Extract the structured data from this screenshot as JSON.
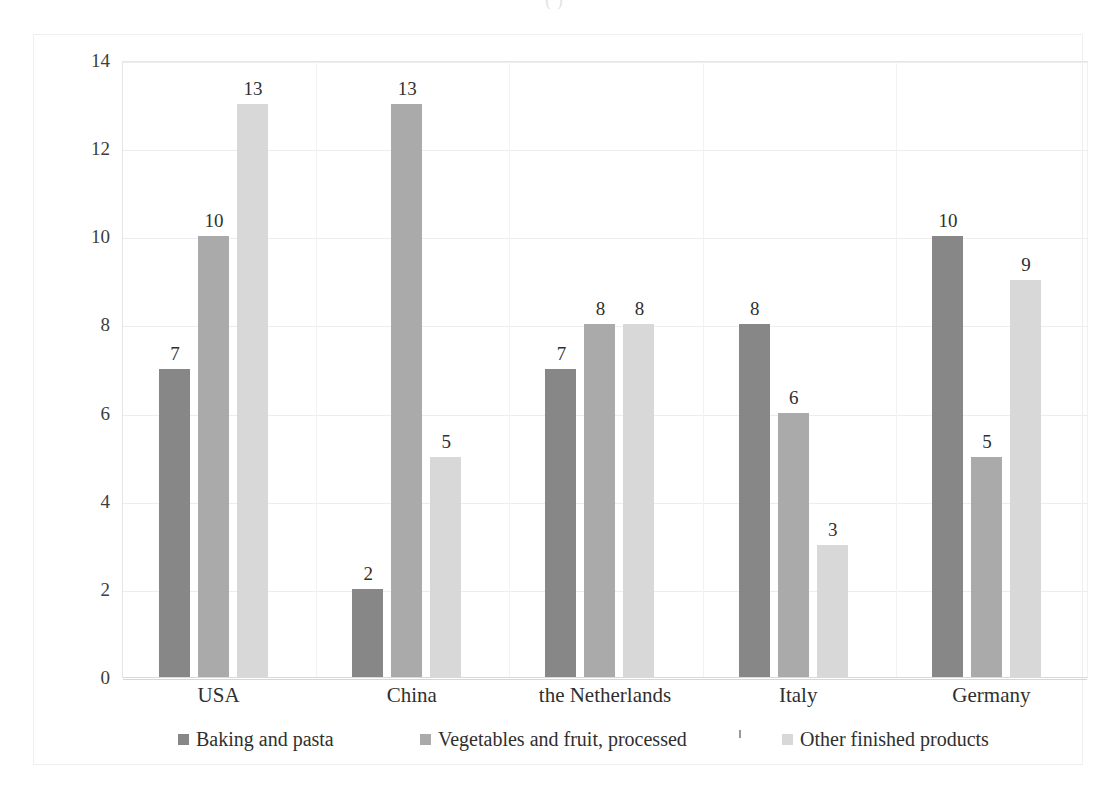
{
  "top_caption": "(           )",
  "chart_data": {
    "type": "bar",
    "title": "",
    "subtitle": "",
    "xlabel": "",
    "ylabel": "",
    "ylim": [
      0,
      14
    ],
    "yticks": [
      "0",
      "2",
      "4",
      "6",
      "8",
      "10",
      "12",
      "14"
    ],
    "grid": true,
    "legend_position": "bottom",
    "categories": [
      "USA",
      "China",
      "the Netherlands",
      "Italy",
      "Germany"
    ],
    "series": [
      {
        "name": "Baking and pasta",
        "color": "#878787",
        "values": [
          7,
          2,
          7,
          8,
          10
        ],
        "labels": [
          "7",
          "2",
          "7",
          "8",
          "10"
        ]
      },
      {
        "name": "Vegetables and fruit, processed",
        "color": "#aaaaaa",
        "values": [
          10,
          13,
          8,
          6,
          5
        ],
        "labels": [
          "10",
          "13",
          "8",
          "6",
          "5"
        ]
      },
      {
        "name": "Other finished products",
        "color": "#d8d8d8",
        "values": [
          13,
          5,
          8,
          3,
          9
        ],
        "labels": [
          "13",
          "5",
          "8",
          "3",
          "9"
        ]
      }
    ]
  },
  "axis": {
    "y_ticks": [
      {
        "label": "14",
        "value": 14
      },
      {
        "label": "12",
        "value": 12
      },
      {
        "label": "10",
        "value": 10
      },
      {
        "label": "8",
        "value": 8
      },
      {
        "label": "6",
        "value": 6
      },
      {
        "label": "4",
        "value": 4
      },
      {
        "label": "2",
        "value": 2
      },
      {
        "label": "0",
        "value": 0
      }
    ],
    "x_categories": [
      "USA",
      "China",
      "the Netherlands",
      "Italy",
      "Germany"
    ]
  },
  "legend": {
    "items": [
      {
        "label": "Baking and pasta",
        "color": "#878787"
      },
      {
        "label": "Vegetables and fruit, processed",
        "color": "#aaaaaa"
      },
      {
        "label": "Other finished products",
        "color": "#d8d8d8"
      }
    ]
  },
  "colors": {
    "series_1": "#878787",
    "series_2": "#aaaaaa",
    "series_3": "#d8d8d8",
    "gridline": "#ededf1",
    "frame": "#efeff2",
    "text": "#2f2f2f",
    "background": "#ffffff"
  }
}
